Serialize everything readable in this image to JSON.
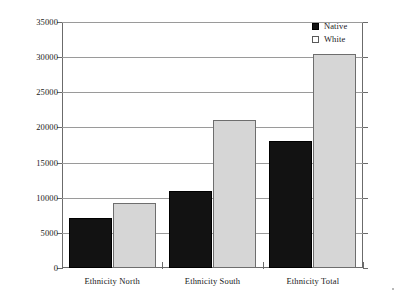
{
  "chart_data": {
    "type": "bar",
    "title": "",
    "subtitle": "",
    "xlabel": "",
    "ylabel": "",
    "categories": [
      "Ethnicity North",
      "Ethnicity South",
      "Ethnicity Total"
    ],
    "series": [
      {
        "name": "Native",
        "color": "#121212",
        "values": [
          7100,
          10900,
          18000
        ]
      },
      {
        "name": "White",
        "color": "#d6d6d6",
        "values": [
          9300,
          21100,
          30400
        ]
      }
    ],
    "ylim": [
      0,
      35000
    ],
    "yticks": [
      0,
      5000,
      10000,
      15000,
      20000,
      25000,
      30000,
      35000
    ],
    "ytick_labels": [
      "0",
      "5000",
      "10000",
      "15000",
      "20000",
      "25000",
      "30000",
      "35000"
    ],
    "grid": true,
    "grid_axis": "y",
    "legend_position": "top-right",
    "legend_entries": [
      "Native",
      "White"
    ],
    "annotations": []
  },
  "legend": {
    "items": [
      {
        "label": "Native",
        "swatch": "filled-black-square"
      },
      {
        "label": "White",
        "swatch": "outlined-white-square"
      }
    ]
  },
  "axes": {
    "y": {
      "labels": [
        "35000",
        "30000",
        "25000",
        "20000",
        "15000",
        "10000",
        "5000",
        "0"
      ]
    },
    "x": {
      "labels": [
        "Ethnicity North",
        "Ethnicity South",
        "Ethnicity Total"
      ]
    }
  }
}
